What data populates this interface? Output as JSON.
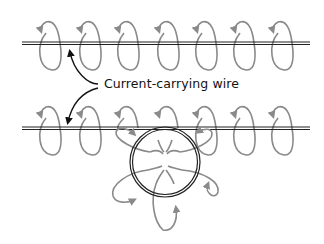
{
  "diagram": {
    "label": "Current-carrying wire",
    "colors": {
      "wire": "#222222",
      "field_loop": "#8a8a8a",
      "pointer_arrow": "#111111",
      "background": "#ffffff"
    },
    "wires": [
      {
        "name": "straight-wire-top",
        "y": 43,
        "x_start": 22,
        "x_end": 310
      },
      {
        "name": "straight-wire-bottom",
        "y": 128,
        "x_start": 22,
        "x_end": 310,
        "has_loop": true
      }
    ],
    "field_loop_columns_x": [
      60,
      100,
      138,
      178,
      216,
      254,
      292
    ],
    "wire_loop": {
      "cx": 165,
      "cy": 162,
      "r": 35
    }
  }
}
